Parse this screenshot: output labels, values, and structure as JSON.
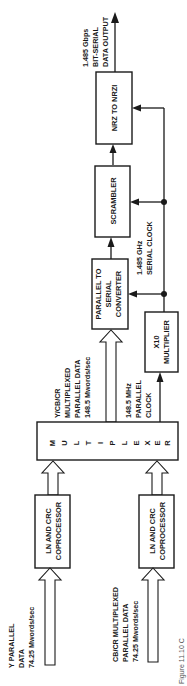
{
  "figure": {
    "caption": "Figure 11.10 C",
    "orientation": "rotated-90-ccw"
  },
  "blocks": {
    "nrz": {
      "label": "NRZ TO NRZI"
    },
    "scrambler": {
      "label": "SCRAMBLER"
    },
    "p2s": {
      "lines": [
        "PARALLEL TO",
        "SERIAL",
        "CONVERTER"
      ]
    },
    "multiplier": {
      "lines": [
        "X10",
        "MULTIPLIER"
      ]
    },
    "mux": {
      "letters": [
        "M",
        "U",
        "L",
        "T",
        "I",
        "P",
        "L",
        "E",
        "X",
        "E",
        "R"
      ]
    },
    "lncrc_y": {
      "lines": [
        "LN AND CRC",
        "COPROCESSOR"
      ]
    },
    "lncrc_c": {
      "lines": [
        "LN AND CRC",
        "COPROCESSOR"
      ]
    }
  },
  "labels": {
    "output": [
      "1.485 Gbps",
      "BIT-SERIAL",
      "DATA OUTPUT"
    ],
    "serial_clock": [
      "1.485 GHz",
      "SERIAL CLOCK"
    ],
    "mux_data": [
      "Y/CB/CR",
      "MULTIPLEXED",
      "PARALLEL DATA",
      "148.5 Mwords/sec"
    ],
    "parallel_clock": [
      "148.5 MHz",
      "PARALLEL",
      "CLOCK"
    ],
    "y_input": [
      "Y PARALLEL",
      "DATA",
      "74.25 Mwords/sec"
    ],
    "c_input": [
      "CB/CR MULTIPLEXED",
      "PARALLEL DATA",
      "74.25 Mwords/sec"
    ]
  }
}
